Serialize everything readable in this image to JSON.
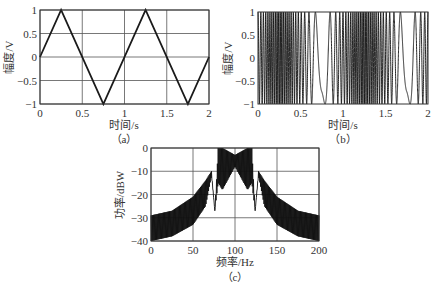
{
  "chart_data": [
    {
      "id": "a",
      "type": "line",
      "caption": "（a）",
      "title": "",
      "xlabel": "时间/s",
      "ylabel": "幅度/V",
      "xlim": [
        0,
        2
      ],
      "ylim": [
        -1,
        1
      ],
      "xticks": [
        "0",
        "0.5",
        "1",
        "1.5",
        "2"
      ],
      "yticks": [
        "1",
        "0.5",
        "0",
        "-0.5",
        "-1"
      ],
      "grid": true,
      "description": "Triangle wave, period 1 s, amplitude 1 V",
      "x": [
        0,
        0.25,
        0.75,
        1.25,
        1.75,
        2.0
      ],
      "y": [
        0,
        1,
        -1,
        1,
        -1,
        0
      ]
    },
    {
      "id": "b",
      "type": "line",
      "caption": "（b）",
      "title": "",
      "xlabel": "时间/s",
      "ylabel": "幅度/V",
      "xlim": [
        0,
        2
      ],
      "ylim": [
        -1,
        1
      ],
      "xticks": [
        "0",
        "0.5",
        "1",
        "1.5",
        "2"
      ],
      "yticks": [
        "1",
        "0.5",
        "0",
        "-0.5",
        "-1"
      ],
      "grid": false,
      "description": "Frequency-modulated signal cos(2*pi*fc*t + phase) driven by the triangle wave in (a); dense oscillation near t=0.25 and 1.25 s, slow oscillation near t=0.75 and 1.75 s",
      "carrier_hz": 100,
      "deviation_hz": 25,
      "modulation_period_s": 1
    },
    {
      "id": "c",
      "type": "line",
      "caption": "（c）",
      "title": "",
      "xlabel": "频率/Hz",
      "ylabel": "功率/dBW",
      "xlim": [
        0,
        200
      ],
      "ylim": [
        -40,
        0
      ],
      "xticks": [
        "0",
        "50",
        "100",
        "150",
        "200"
      ],
      "yticks": [
        "0",
        "-10",
        "-20",
        "-30",
        "-40"
      ],
      "grid": true,
      "description": "Power spectrum of FM signal: flat top ~0 to -10 dBW between ~80 and 120 Hz, shoulders near -10 dBW at ~72 and ~130 Hz, notches near -27 dBW at ~76 and ~124 Hz, skirts falling to about -30 to -40 dBW at 0 and 200 Hz",
      "envelope_x": [
        0,
        25,
        50,
        65,
        72,
        76,
        80,
        85,
        100,
        115,
        120,
        124,
        128,
        135,
        150,
        175,
        200
      ],
      "envelope_upper": [
        -29,
        -27,
        -21,
        -14,
        -10,
        -27,
        0,
        0,
        -3,
        0,
        0,
        -27,
        -10,
        -14,
        -21,
        -27,
        -29
      ],
      "envelope_lower": [
        -40,
        -38,
        -33,
        -25,
        -12,
        -27,
        -15,
        -18,
        -8,
        -18,
        -15,
        -27,
        -12,
        -25,
        -33,
        -38,
        -40
      ]
    }
  ]
}
